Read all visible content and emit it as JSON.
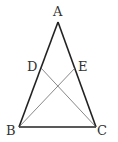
{
  "diagram": {
    "type": "isosceles triangle with cevians",
    "points": {
      "A": {
        "label": "A",
        "x": 58,
        "y": 22
      },
      "B": {
        "label": "B",
        "x": 19,
        "y": 127
      },
      "C": {
        "label": "C",
        "x": 96,
        "y": 127
      },
      "D": {
        "label": "D",
        "x": 41,
        "y": 68
      },
      "E": {
        "label": "E",
        "x": 75,
        "y": 68
      }
    },
    "segments": [
      "AB",
      "AC",
      "BC",
      "BE",
      "CD"
    ],
    "colors": {
      "edge": "#222222",
      "cevian": "#555555",
      "label": "#333333"
    }
  }
}
